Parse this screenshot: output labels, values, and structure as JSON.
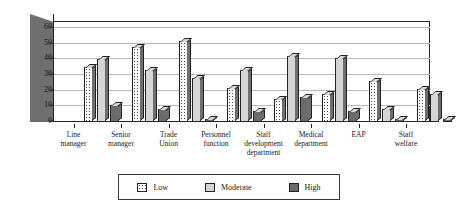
{
  "chart_data": {
    "type": "bar",
    "title": "",
    "subtitle": "",
    "xlabel": "",
    "ylabel": "",
    "ylim": [
      0,
      60
    ],
    "yticks": [
      0,
      10,
      20,
      30,
      40,
      50,
      60
    ],
    "grid": true,
    "legend_position": "bottom",
    "style": "3d-clustered-column",
    "categories": [
      "Line manager",
      "Senior manager",
      "Trade Union",
      "Personnel function",
      "Staff development department",
      "Medical department",
      "EAP",
      "Staff welfare"
    ],
    "category_lines": [
      [
        "Line",
        "manager"
      ],
      [
        "Senior",
        "manager"
      ],
      [
        "Trade",
        "Union"
      ],
      [
        "Personnel",
        "function"
      ],
      [
        "Staff",
        "development",
        "department"
      ],
      [
        "Medical",
        "department"
      ],
      [
        "EAP"
      ],
      [
        "Staff",
        "welfare"
      ]
    ],
    "series": [
      {
        "name": "Low",
        "fill": "dotted-light",
        "values": [
          35,
          48,
          52,
          22,
          15,
          18,
          26,
          21
        ]
      },
      {
        "name": "Moderate",
        "fill": "dotted-mid",
        "values": [
          40,
          33,
          28,
          33,
          42,
          41,
          8,
          18
        ]
      },
      {
        "name": "High",
        "fill": "solid-dark",
        "values": [
          11,
          8,
          2,
          7,
          16,
          7,
          2,
          2
        ]
      }
    ]
  },
  "legend": {
    "items": [
      {
        "label": "Low"
      },
      {
        "label": "Moderate"
      },
      {
        "label": "High"
      }
    ]
  },
  "colors": {
    "axis": "#222222",
    "grid": "#b9b9b9",
    "wall": "#6f6f6f",
    "low": "#ffffff",
    "moderate": "#d5d5d5",
    "high": "#6b6b6b",
    "background": "#ffffff"
  }
}
